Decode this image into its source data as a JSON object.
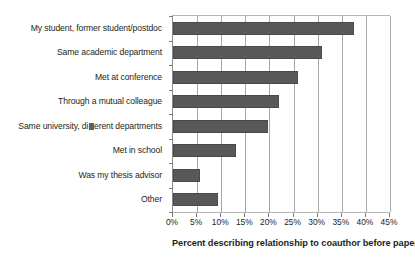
{
  "chart_data": {
    "type": "bar",
    "orientation": "horizontal",
    "title": "",
    "xlabel": "Percent describing relationship to coauthor before paper",
    "ylabel": "",
    "xlim": [
      0,
      45
    ],
    "xtick_step": 5,
    "grid": "vertical",
    "legend": "none",
    "bar_color": "#585858",
    "categories": [
      "My student, former student/postdoc",
      "Same academic department",
      "Met at conference",
      "Through a mutual colleague",
      "Same university, di▨erent departments",
      "Met in school",
      "Was my thesis advisor",
      "Other"
    ],
    "values": [
      37.5,
      31.0,
      26.0,
      22.0,
      19.7,
      13.0,
      5.7,
      9.3
    ],
    "tick_labels": [
      "0%",
      "5%",
      "10%",
      "15%",
      "20%",
      "25%",
      "30%",
      "35%",
      "40%",
      "45%"
    ],
    "tick_values": [
      0,
      5,
      10,
      15,
      20,
      25,
      30,
      35,
      40,
      45
    ]
  },
  "category_labels": [
    {
      "pre": "My student, former student/postdoc",
      "glyph": "",
      "post": ""
    },
    {
      "pre": "Same academic department",
      "glyph": "",
      "post": ""
    },
    {
      "pre": "Met at conference",
      "glyph": "",
      "post": ""
    },
    {
      "pre": "Through a mutual colleague",
      "glyph": "",
      "post": ""
    },
    {
      "pre": "Same university, di",
      "glyph": "tofu",
      "post": "erent departments"
    },
    {
      "pre": "Met in school",
      "glyph": "",
      "post": ""
    },
    {
      "pre": "Was my thesis advisor",
      "glyph": "",
      "post": ""
    },
    {
      "pre": "Other",
      "glyph": "",
      "post": ""
    }
  ]
}
